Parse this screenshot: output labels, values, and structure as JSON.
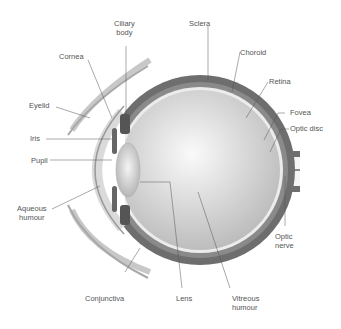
{
  "diagram": {
    "labels": {
      "ciliary_body": "Ciliary\nbody",
      "sclera": "Sclera",
      "cornea": "Cornea",
      "choroid": "Choroid",
      "retina": "Retina",
      "eyelid": "Eyelid",
      "fovea": "Fovea",
      "optic_disc": "Optic disc",
      "iris": "Iris",
      "pupil": "Pupil",
      "aqueous_humour": "Aqueous\nhumour",
      "optic_nerve": "Optic\nnerve",
      "conjunctiva": "Conjunctiva",
      "lens": "Lens",
      "vitreous_humour": "Vitreous\nhumour"
    },
    "colors": {
      "sclera": "#6e6e6e",
      "choroid": "#8a8a8a",
      "retina": "#e8e8e8",
      "vitreous": "#c9c9c9",
      "cornea": "#dadada",
      "eyelid": "#bdbdbd",
      "leader": "#555555"
    }
  }
}
